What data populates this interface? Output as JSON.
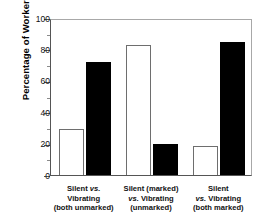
{
  "chart_data": {
    "type": "bar",
    "title": "",
    "xlabel": "",
    "ylabel": "Percentage of Workers",
    "ylim": [
      0,
      100
    ],
    "y_ticks": [
      0,
      20,
      40,
      60,
      80,
      100
    ],
    "y_minor_ticks": [
      10,
      30,
      50,
      70,
      90
    ],
    "grid": false,
    "legend": "none",
    "categories": [
      "Silent vs. Vibrating (both unmarked)",
      "Silent (marked) vs. Vibrating (unmarked)",
      "Silent vs. Vibrating (both marked)"
    ],
    "series": [
      {
        "name": "open-bar",
        "fill": "white",
        "values": [
          29,
          83,
          18.5
        ]
      },
      {
        "name": "filled-bar",
        "fill": "black",
        "values": [
          72,
          20,
          85
        ]
      }
    ]
  },
  "axes": {
    "y_title": "Percentage of Workers",
    "y_tick_labels": [
      "100",
      "80",
      "60",
      "40",
      "20",
      "0"
    ]
  },
  "x_labels": [
    {
      "line1_a": "Silent ",
      "line1_em": "vs.",
      "line1_b": "",
      "line2": "Vibrating",
      "line3": "(both unmarked)"
    },
    {
      "line1_a": "Silent (marked)",
      "line1_em": "",
      "line1_b": "",
      "line2_em": "vs.",
      "line2": " Vibrating",
      "line3": "(unmarked)"
    },
    {
      "line1_a": "Silent",
      "line1_em": "",
      "line1_b": "",
      "line2_em": "vs.",
      "line2": " Vibrating",
      "line3": "(both marked)"
    }
  ],
  "colors": {
    "open_bar_fill": "#ffffff",
    "open_bar_stroke": "#6e6e6e",
    "filled_bar": "#000000",
    "axis": "#555555",
    "frame": "#a8a8a8",
    "text": "#111111"
  }
}
